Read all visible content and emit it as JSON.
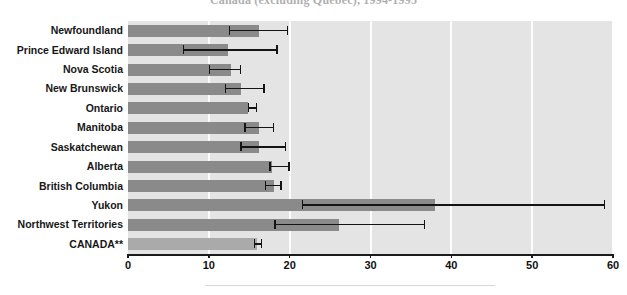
{
  "chart_data": {
    "type": "bar",
    "orientation": "horizontal",
    "title": "Canada (excluding Quebec), 1994-1995",
    "xlabel": "",
    "ylabel": "",
    "xlim": [
      0,
      60
    ],
    "xticks": [
      0,
      10,
      20,
      30,
      40,
      50,
      60
    ],
    "grid": true,
    "grid_orientation": "vertical",
    "legend": "none",
    "bar_color": "#8a8a8a",
    "total_bar_color": "#aaaaaa",
    "error_bar_color": "#141414",
    "plot_background": "#e4e4e4",
    "categories": [
      "Newfoundland",
      "Prince Edward Island",
      "Nova Scotia",
      "New Brunswick",
      "Ontario",
      "Manitoba",
      "Saskatchewan",
      "Alberta",
      "British Columbia",
      "Yukon",
      "Northwest Territories",
      "CANADA**"
    ],
    "values": [
      16.2,
      12.4,
      12.7,
      14.0,
      14.8,
      16.2,
      16.2,
      17.8,
      18.0,
      38.0,
      26.1,
      15.9
    ],
    "error_low": [
      12.5,
      6.8,
      10.0,
      12.0,
      14.8,
      14.4,
      13.9,
      17.5,
      16.9,
      21.5,
      18.1,
      15.6
    ],
    "error_high": [
      19.8,
      18.5,
      14.0,
      16.9,
      16.0,
      18.1,
      19.6,
      20.0,
      19.0,
      59.0,
      36.8,
      16.6
    ],
    "rows": [
      {
        "label": "Newfoundland",
        "value": 16.2,
        "low": 12.5,
        "high": 19.8,
        "is_total": false
      },
      {
        "label": "Prince Edward Island",
        "value": 12.4,
        "low": 6.8,
        "high": 18.5,
        "is_total": false
      },
      {
        "label": "Nova Scotia",
        "value": 12.7,
        "low": 10.0,
        "high": 14.0,
        "is_total": false
      },
      {
        "label": "New Brunswick",
        "value": 14.0,
        "low": 12.0,
        "high": 16.9,
        "is_total": false
      },
      {
        "label": "Ontario",
        "value": 14.8,
        "low": 14.8,
        "high": 16.0,
        "is_total": false
      },
      {
        "label": "Manitoba",
        "value": 16.2,
        "low": 14.4,
        "high": 18.1,
        "is_total": false
      },
      {
        "label": "Saskatchewan",
        "value": 16.2,
        "low": 13.9,
        "high": 19.6,
        "is_total": false
      },
      {
        "label": "Alberta",
        "value": 17.8,
        "low": 17.5,
        "high": 20.0,
        "is_total": false
      },
      {
        "label": "British Columbia",
        "value": 18.0,
        "low": 16.9,
        "high": 19.0,
        "is_total": false
      },
      {
        "label": "Yukon",
        "value": 38.0,
        "low": 21.5,
        "high": 59.0,
        "is_total": false
      },
      {
        "label": "Northwest Territories",
        "value": 26.1,
        "low": 18.1,
        "high": 36.8,
        "is_total": false
      },
      {
        "label": "CANADA**",
        "value": 15.9,
        "low": 15.6,
        "high": 16.6,
        "is_total": true
      }
    ]
  }
}
